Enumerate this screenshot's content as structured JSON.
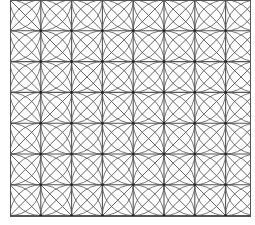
{
  "pattern": {
    "type": "geometric-tiling",
    "description": "Square grid with diagonals and circular arcs centered on grid nodes",
    "origin_x": 10,
    "origin_y": 0,
    "cell": 30.8,
    "cols": 8,
    "rows": 7,
    "clip": {
      "x": 10,
      "y": 0,
      "width": 241,
      "height": 217
    },
    "colors": {
      "background": "#ffffff",
      "line": "#555555",
      "node": "#222222"
    }
  }
}
